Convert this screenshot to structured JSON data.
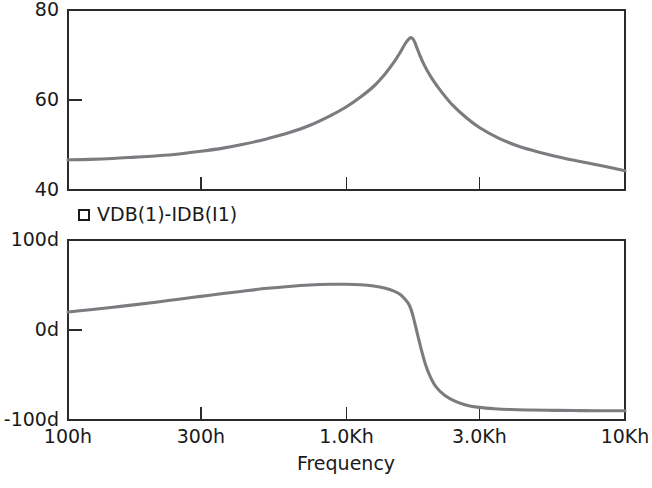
{
  "chart_data": [
    {
      "type": "line",
      "id": "magnitude-plot",
      "title": "",
      "xlabel": "",
      "ylabel": "",
      "xscale": "log",
      "xlim": [
        100,
        10000
      ],
      "ylim": [
        40,
        80
      ],
      "grid": false,
      "legend_position": "below-plot",
      "legend": [
        "VDB(1)-IDB(I1)"
      ],
      "xticks": [
        100,
        300,
        1000,
        3000,
        10000
      ],
      "xticklabels": [
        "100h",
        "300h",
        "1.0Kh",
        "3.0Kh",
        "10Kh"
      ],
      "yticks": [
        40,
        60,
        80
      ],
      "yticklabels": [
        "40",
        "60",
        "80"
      ],
      "series": [
        {
          "name": "VDB(1)-IDB(I1)",
          "color": "#7c7c80",
          "x": [
            100,
            120,
            145,
            175,
            210,
            250,
            300,
            360,
            430,
            520,
            620,
            740,
            880,
            1000,
            1120,
            1250,
            1380,
            1480,
            1560,
            1620,
            1665,
            1700,
            1730,
            1760,
            1790,
            1830,
            1880,
            1950,
            2050,
            2200,
            2400,
            2700,
            3000,
            3500,
            4200,
            5000,
            6000,
            7200,
            8500,
            10000
          ],
          "y": [
            46.7,
            46.8,
            47.0,
            47.3,
            47.6,
            48.0,
            48.6,
            49.3,
            50.2,
            51.4,
            52.7,
            54.4,
            56.6,
            58.5,
            60.6,
            63.0,
            65.9,
            68.4,
            70.6,
            72.4,
            73.4,
            73.9,
            73.6,
            72.8,
            71.6,
            70.1,
            68.4,
            66.5,
            64.3,
            61.7,
            58.9,
            56.0,
            53.9,
            51.6,
            49.6,
            48.3,
            47.1,
            46.1,
            45.2,
            44.3
          ]
        }
      ]
    },
    {
      "type": "line",
      "id": "phase-plot",
      "title": "",
      "xlabel": "Frequency",
      "ylabel": "",
      "xscale": "log",
      "xlim": [
        100,
        10000
      ],
      "ylim": [
        -100,
        100
      ],
      "grid": false,
      "legend_position": "above-plot",
      "legend": [
        "VDB(1)-IDB(I1)"
      ],
      "xticks": [
        100,
        300,
        1000,
        3000,
        10000
      ],
      "xticklabels": [
        "100h",
        "300h",
        "1.0Kh",
        "3.0Kh",
        "10Kh"
      ],
      "yticks": [
        -100,
        0,
        100
      ],
      "yticklabels": [
        "-100d",
        "0d",
        "100d"
      ],
      "series": [
        {
          "name": "VDB(1)-IDB(I1)",
          "color": "#7c7c80",
          "x": [
            100,
            120,
            145,
            175,
            210,
            250,
            300,
            360,
            430,
            520,
            620,
            740,
            880,
            1000,
            1120,
            1250,
            1380,
            1480,
            1560,
            1620,
            1665,
            1700,
            1740,
            1790,
            1850,
            1920,
            2000,
            2100,
            2250,
            2450,
            2700,
            3000,
            3400,
            3900,
            4600,
            5500,
            6600,
            8000,
            10000
          ],
          "y": [
            20.0,
            22.5,
            25.3,
            28.2,
            31.2,
            34.2,
            37.4,
            40.5,
            43.4,
            46.3,
            48.4,
            50.0,
            50.8,
            50.8,
            50.2,
            48.8,
            46.3,
            43.2,
            39.4,
            34.5,
            29.8,
            24.0,
            13.5,
            -2.0,
            -20.0,
            -38.0,
            -52.0,
            -63.5,
            -72.5,
            -79.0,
            -83.5,
            -86.0,
            -87.5,
            -88.4,
            -88.9,
            -89.3,
            -89.5,
            -89.7,
            -89.8
          ]
        }
      ]
    }
  ],
  "geometry": {
    "magnitude_plot": {
      "left": 68,
      "right": 625,
      "top": 10,
      "bottom": 190
    },
    "phase_plot": {
      "left": 68,
      "right": 625,
      "top": 240,
      "bottom": 420
    },
    "legend": {
      "marker_x": 84,
      "marker_y": 215,
      "text_x": 97,
      "text_y": 215
    },
    "xaxis_title": {
      "x": 346,
      "y": 456
    }
  },
  "colors": {
    "trace": "#7c7c80",
    "axis": "#2b2b2b",
    "text": "#1a1a1a",
    "background": "#ffffff"
  }
}
